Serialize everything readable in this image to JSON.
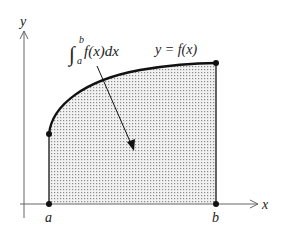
{
  "diagram": {
    "axes": {
      "x_label": "x",
      "y_label": "y"
    },
    "bounds": {
      "lower": "a",
      "upper": "b"
    },
    "curve_label": "y = f(x)",
    "integral": {
      "symbol": "∫",
      "upper_limit": "b",
      "lower_limit": "a",
      "integrand": "f(x)dx"
    },
    "colors": {
      "stroke": "#111111",
      "axis": "#666666",
      "fill_dot": "#8a8a8a"
    }
  }
}
